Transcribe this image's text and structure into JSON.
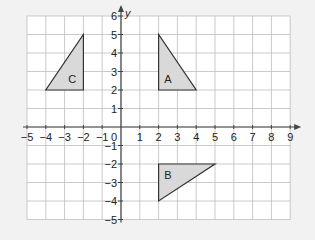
{
  "diagram": {
    "type": "coordinate-grid",
    "x_axis": {
      "label": "",
      "min": -5,
      "max": 9,
      "ticks": [
        "-5",
        "-4",
        "-3",
        "-2",
        "-1",
        "1",
        "2",
        "3",
        "4",
        "5",
        "6",
        "7",
        "8",
        "9"
      ]
    },
    "y_axis": {
      "label": "y",
      "min": -5,
      "max": 6,
      "ticks": [
        "6",
        "5",
        "4",
        "3",
        "2",
        "1",
        "-1",
        "-2",
        "-3",
        "-4",
        "-5"
      ]
    },
    "origin_label": "0",
    "colors": {
      "grid": "#bdbdbd",
      "axis": "#444444",
      "fill": "#d9d9d9",
      "stroke": "#333333",
      "background": "#ffffff"
    },
    "shapes": [
      {
        "name": "A",
        "vertices": [
          [
            2,
            5
          ],
          [
            2,
            2
          ],
          [
            4,
            2
          ]
        ],
        "label_pos": [
          2.5,
          2.6
        ]
      },
      {
        "name": "B",
        "vertices": [
          [
            2,
            -2
          ],
          [
            5,
            -2
          ],
          [
            2,
            -4
          ]
        ],
        "label_pos": [
          2.5,
          -2.6
        ]
      },
      {
        "name": "C",
        "vertices": [
          [
            -2,
            5
          ],
          [
            -2,
            2
          ],
          [
            -4,
            2
          ]
        ],
        "label_pos": [
          -2.6,
          2.6
        ]
      }
    ]
  }
}
